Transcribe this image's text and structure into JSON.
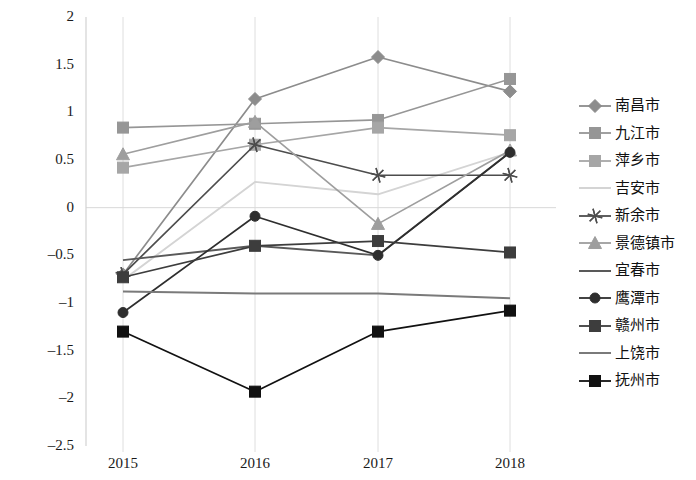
{
  "chart_data": {
    "type": "line",
    "title": "",
    "xlabel": "",
    "ylabel": "",
    "categories": [
      "2015",
      "2016",
      "2017",
      "2018"
    ],
    "x_tick_labels": [
      "2015",
      "2016",
      "2017",
      "2018"
    ],
    "y_tick_labels": [
      "2",
      "1.5",
      "1",
      "0.5",
      "0",
      "-0.5",
      "-1",
      "-1.5",
      "-2",
      "-2.5"
    ],
    "y_tick_values": [
      2,
      1.5,
      1,
      0.5,
      0,
      -0.5,
      -1,
      -1.5,
      -2,
      -2.5
    ],
    "ylim": [
      -2.5,
      2
    ],
    "grid": "vertical-gridlines-and-zero-line",
    "legend_position": "right",
    "series": [
      {
        "name": "南昌市",
        "marker": "diamond",
        "color": "#8c8c8c",
        "values": [
          -0.7,
          1.14,
          1.58,
          1.22
        ]
      },
      {
        "name": "九江市",
        "marker": "square",
        "color": "#969696",
        "values": [
          0.84,
          0.88,
          0.92,
          1.35
        ]
      },
      {
        "name": "萍乡市",
        "marker": "square",
        "color": "#a6a6a6",
        "values": [
          0.42,
          0.66,
          0.84,
          0.76
        ]
      },
      {
        "name": "吉安市",
        "marker": "none",
        "color": "#d4d4d4",
        "values": [
          -0.76,
          0.27,
          0.14,
          0.58
        ]
      },
      {
        "name": "新余市",
        "marker": "star",
        "color": "#4d4d4d",
        "values": [
          -0.7,
          0.66,
          0.34,
          0.34
        ]
      },
      {
        "name": "景德镇市",
        "marker": "triangle",
        "color": "#9e9e9e",
        "values": [
          0.56,
          0.9,
          -0.17,
          0.6
        ]
      },
      {
        "name": "宜春市",
        "marker": "none",
        "color": "#595959",
        "values": [
          -0.55,
          -0.4,
          -0.5,
          0.58
        ]
      },
      {
        "name": "鹰潭市",
        "marker": "circle",
        "color": "#2e2e2e",
        "values": [
          -1.1,
          -0.09,
          -0.5,
          0.58
        ]
      },
      {
        "name": "赣州市",
        "marker": "square",
        "color": "#3d3d3d",
        "values": [
          -0.73,
          -0.4,
          -0.35,
          -0.47
        ]
      },
      {
        "name": "上饶市",
        "marker": "none",
        "color": "#7a7a7a",
        "values": [
          -0.88,
          -0.9,
          -0.9,
          -0.95
        ]
      },
      {
        "name": "抚州市",
        "marker": "square",
        "color": "#111111",
        "values": [
          -1.3,
          -1.93,
          -1.3,
          -1.08
        ]
      }
    ]
  },
  "legend": {
    "items": [
      {
        "label": "南昌市"
      },
      {
        "label": "九江市"
      },
      {
        "label": "萍乡市"
      },
      {
        "label": "吉安市"
      },
      {
        "label": "新余市"
      },
      {
        "label": "景德镇市"
      },
      {
        "label": "宜春市"
      },
      {
        "label": "鹰潭市"
      },
      {
        "label": "赣州市"
      },
      {
        "label": "上饶市"
      },
      {
        "label": "抚州市"
      }
    ]
  }
}
